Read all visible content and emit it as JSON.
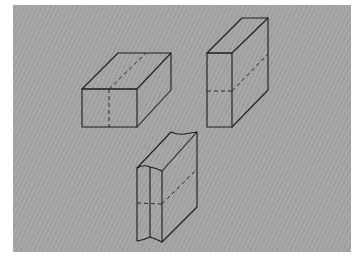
{
  "figure": {
    "background_color": "#a4a4a4",
    "line_color": "#1e1e1e",
    "objects": [
      {
        "id": "block-flat",
        "label": "Horizontal block with vertical dashed section"
      },
      {
        "id": "block-upright",
        "label": "Upright slab with horizontal dashed section"
      },
      {
        "id": "block-grooved",
        "label": "Upright slab with grooved front face and horizontal dashed section"
      }
    ]
  }
}
